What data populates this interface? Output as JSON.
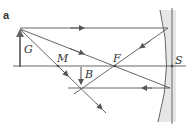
{
  "figure": {
    "panel_label": "a",
    "labels": {
      "object": "G",
      "image": "B",
      "center": "M",
      "focus": "F",
      "vertex": "S"
    },
    "colors": {
      "line": "#555555",
      "mirror_shade": "#e3e3e3"
    }
  }
}
